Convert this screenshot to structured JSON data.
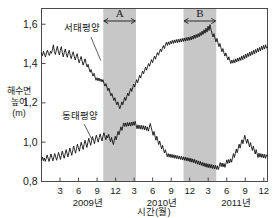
{
  "chart_data": {
    "type": "line",
    "title": "",
    "xlabel": "시간(월)",
    "ylabel": "해수면 높이 (m)",
    "ylabel_lines": [
      "해수면",
      "높이",
      "(m)"
    ],
    "ylim": [
      0.8,
      1.68
    ],
    "xlim": [
      0.0,
      36.6
    ],
    "grid": false,
    "legend_position": "inline-annotation",
    "y_ticks": [
      {
        "value": 1.6,
        "label": "1,6"
      },
      {
        "value": 1.4,
        "label": "1,4"
      },
      {
        "value": 1.2,
        "label": "1,2"
      },
      {
        "value": 1.0,
        "label": "1,0"
      },
      {
        "value": 0.8,
        "label": "0,8"
      }
    ],
    "x_ticks": [
      {
        "value": 3,
        "label": "3"
      },
      {
        "value": 6,
        "label": "6"
      },
      {
        "value": 9,
        "label": "9"
      },
      {
        "value": 12,
        "label": "12"
      },
      {
        "value": 15,
        "label": "3"
      },
      {
        "value": 18,
        "label": "6"
      },
      {
        "value": 21,
        "label": "9"
      },
      {
        "value": 24,
        "label": "12"
      },
      {
        "value": 27,
        "label": "3"
      },
      {
        "value": 30,
        "label": "6"
      },
      {
        "value": 33,
        "label": "9"
      },
      {
        "value": 36,
        "label": "12"
      }
    ],
    "year_labels": [
      {
        "label": "2009년",
        "center_value": 7.5
      },
      {
        "label": "2010년",
        "center_value": 19.5
      },
      {
        "label": "2011년",
        "center_value": 31.5
      }
    ],
    "shaded_regions": [
      {
        "label": "A",
        "x_start": 10.0,
        "x_end": 15.3
      },
      {
        "label": "B",
        "x_start": 23.0,
        "x_end": 28.3
      }
    ],
    "series": [
      {
        "name": "서태평양",
        "label_x_value": 6.6,
        "label_y_value": 1.565,
        "leader_from": [
          8.0,
          1.535
        ],
        "leader_to": [
          9.6,
          1.415
        ],
        "values": [
          1.452,
          1.44,
          1.462,
          1.448,
          1.433,
          1.455,
          1.468,
          1.449,
          1.441,
          1.462,
          1.452,
          1.47,
          1.495,
          1.462,
          1.446,
          1.468,
          1.488,
          1.462,
          1.444,
          1.467,
          1.486,
          1.455,
          1.434,
          1.457,
          1.474,
          1.45,
          1.432,
          1.452,
          1.468,
          1.442,
          1.425,
          1.445,
          1.46,
          1.437,
          1.418,
          1.436,
          1.45,
          1.424,
          1.404,
          1.42,
          1.436,
          1.412,
          1.392,
          1.408,
          1.424,
          1.4,
          1.382,
          1.396,
          1.374,
          1.356,
          1.37,
          1.352,
          1.336,
          1.35,
          1.332,
          1.315,
          1.328,
          1.312,
          1.326,
          1.31,
          1.322,
          1.306,
          1.318,
          1.3,
          1.285,
          1.298,
          1.28,
          1.262,
          1.275,
          1.255,
          1.236,
          1.248,
          1.23,
          1.212,
          1.226,
          1.206,
          1.19,
          1.205,
          1.186,
          1.17,
          1.185,
          1.205,
          1.19,
          1.21,
          1.228,
          1.212,
          1.232,
          1.25,
          1.236,
          1.256,
          1.274,
          1.258,
          1.278,
          1.296,
          1.28,
          1.3,
          1.318,
          1.302,
          1.322,
          1.34,
          1.326,
          1.345,
          1.362,
          1.348,
          1.366,
          1.382,
          1.366,
          1.384,
          1.4,
          1.386,
          1.404,
          1.42,
          1.404,
          1.422,
          1.438,
          1.422,
          1.44,
          1.456,
          1.442,
          1.458,
          1.474,
          1.46,
          1.478,
          1.492,
          1.476,
          1.494,
          1.508,
          1.492,
          1.51,
          1.496,
          1.514,
          1.5,
          1.518,
          1.502,
          1.52,
          1.505,
          1.522,
          1.506,
          1.524,
          1.508,
          1.526,
          1.51,
          1.528,
          1.512,
          1.53,
          1.514,
          1.532,
          1.516,
          1.534,
          1.518,
          1.536,
          1.52,
          1.54,
          1.524,
          1.545,
          1.528,
          1.548,
          1.532,
          1.552,
          1.536,
          1.558,
          1.542,
          1.565,
          1.548,
          1.572,
          1.554,
          1.58,
          1.56,
          1.59,
          1.568,
          1.598,
          1.572,
          1.555,
          1.535,
          1.552,
          1.53,
          1.51,
          1.528,
          1.506,
          1.486,
          1.502,
          1.48,
          1.46,
          1.476,
          1.456,
          1.438,
          1.454,
          1.436,
          1.418,
          1.434,
          1.416,
          1.4,
          1.418,
          1.402,
          1.42,
          1.404,
          1.424,
          1.408,
          1.428,
          1.412,
          1.432,
          1.416,
          1.438,
          1.42,
          1.442,
          1.425,
          1.448,
          1.43,
          1.452,
          1.436,
          1.458,
          1.44,
          1.462,
          1.445,
          1.468,
          1.45,
          1.472,
          1.455,
          1.478,
          1.46,
          1.482,
          1.465,
          1.488,
          1.47,
          1.492,
          1.474,
          1.496,
          1.478,
          1.486
        ]
      },
      {
        "name": "동태평양",
        "label_x_value": 6.3,
        "label_y_value": 1.118,
        "leader_from": [
          6.9,
          1.092
        ],
        "leader_to": [
          8.2,
          1.012
        ],
        "values": [
          0.908,
          0.924,
          0.906,
          0.92,
          0.902,
          0.918,
          0.935,
          0.918,
          0.902,
          0.92,
          0.94,
          0.922,
          0.905,
          0.924,
          0.942,
          0.925,
          0.908,
          0.928,
          0.948,
          0.93,
          0.912,
          0.934,
          0.955,
          0.936,
          0.918,
          0.94,
          0.962,
          0.944,
          0.925,
          0.948,
          0.97,
          0.952,
          0.933,
          0.958,
          0.98,
          0.962,
          0.944,
          0.968,
          0.99,
          0.972,
          0.954,
          0.978,
          1.0,
          0.982,
          0.963,
          0.988,
          1.01,
          0.992,
          0.973,
          0.998,
          1.02,
          1.002,
          0.984,
          1.008,
          1.028,
          1.01,
          0.992,
          1.016,
          1.036,
          1.018,
          1.0,
          1.022,
          1.042,
          1.024,
          1.006,
          1.03,
          1.048,
          1.03,
          1.012,
          1.034,
          1.022,
          1.04,
          1.02,
          1.002,
          1.024,
          1.006,
          0.988,
          1.01,
          1.03,
          1.012,
          1.034,
          1.055,
          1.038,
          1.058,
          1.078,
          1.06,
          1.08,
          1.098,
          1.08,
          1.098,
          1.08,
          1.1,
          1.082,
          1.1,
          1.082,
          1.102,
          1.084,
          1.104,
          1.086,
          1.106,
          1.088,
          1.068,
          1.088,
          1.068,
          1.086,
          1.066,
          1.086,
          1.065,
          1.084,
          1.063,
          1.082,
          1.06,
          1.078,
          1.056,
          1.075,
          1.095,
          1.076,
          1.056,
          1.035,
          1.055,
          1.032,
          1.01,
          1.03,
          1.008,
          0.988,
          1.006,
          0.986,
          0.966,
          0.984,
          0.964,
          0.945,
          0.962,
          0.944,
          0.926,
          0.942,
          0.924,
          0.94,
          0.922,
          0.938,
          0.92,
          0.936,
          0.918,
          0.934,
          0.916,
          0.932,
          0.914,
          0.93,
          0.912,
          0.928,
          0.91,
          0.926,
          0.908,
          0.924,
          0.906,
          0.922,
          0.904,
          0.92,
          0.9,
          0.918,
          0.898,
          0.915,
          0.895,
          0.912,
          0.892,
          0.908,
          0.888,
          0.905,
          0.885,
          0.902,
          0.882,
          0.898,
          0.878,
          0.895,
          0.875,
          0.892,
          0.872,
          0.89,
          0.87,
          0.888,
          0.868,
          0.886,
          0.866,
          0.884,
          0.864,
          0.882,
          0.862,
          0.88,
          0.86,
          0.878,
          0.896,
          0.876,
          0.894,
          0.874,
          0.892,
          0.872,
          0.89,
          0.91,
          0.892,
          0.912,
          0.895,
          0.915,
          0.898,
          0.92,
          0.942,
          0.922,
          0.944,
          0.965,
          0.946,
          0.968,
          0.99,
          0.97,
          0.992,
          1.012,
          0.992,
          1.014,
          1.035,
          1.014,
          0.994,
          1.016,
          0.996,
          0.976,
          0.998,
          0.978,
          0.958,
          0.98,
          0.96,
          0.94,
          0.962,
          0.942,
          0.922,
          0.944,
          0.924,
          0.942,
          0.922,
          0.94,
          0.92,
          0.938,
          0.918,
          0.936,
          0.93
        ]
      }
    ]
  }
}
